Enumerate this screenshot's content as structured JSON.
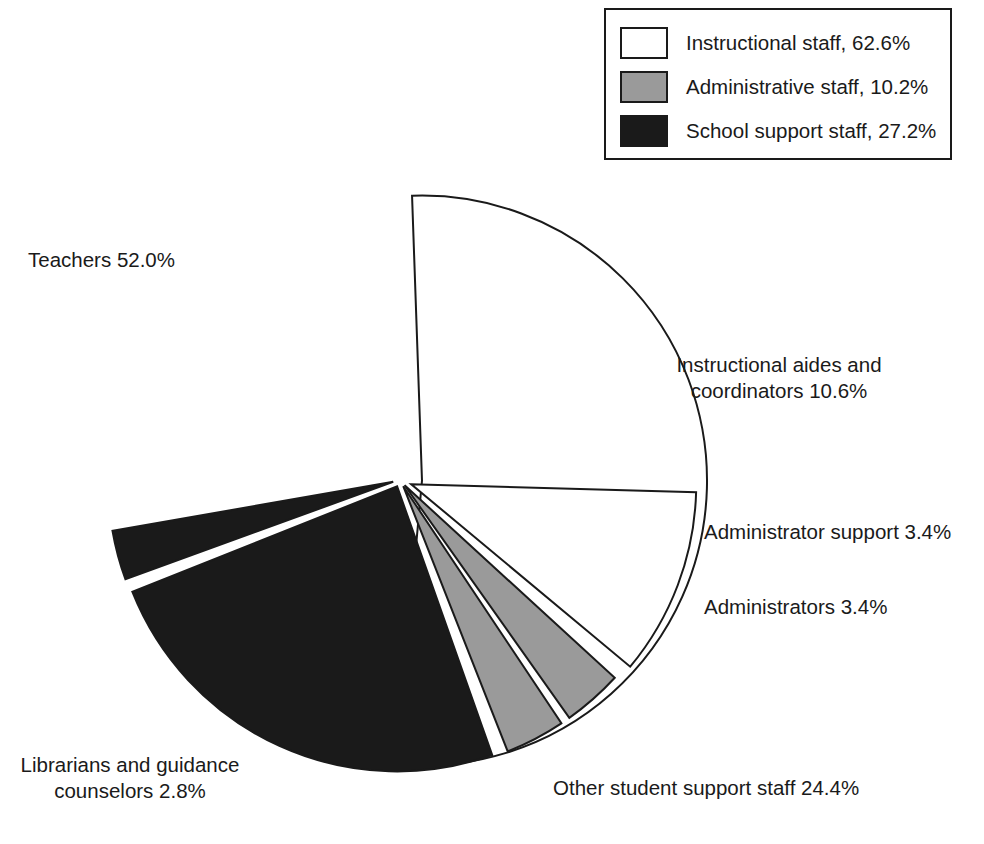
{
  "chart_data": {
    "type": "pie",
    "title": "",
    "total_percent": 100.0,
    "units": "percent",
    "legend": {
      "position": "top-right",
      "entries": [
        {
          "label": "Instructional staff, 62.6%",
          "name": "Instructional staff",
          "value": 62.6,
          "color": "#ffffff",
          "swatch": "white"
        },
        {
          "label": "Administrative staff, 10.2%",
          "name": "Administrative staff",
          "value": 10.2,
          "color": "#9a9a9a",
          "swatch": "gray"
        },
        {
          "label": "School support staff, 27.2%",
          "name": "School support staff",
          "value": 27.2,
          "color": "#1a1a1a",
          "swatch": "black"
        }
      ]
    },
    "categories": [
      "Teachers",
      "Instructional aides and coordinators",
      "Administrator support",
      "Administrators",
      "Other student support staff",
      "Librarians and guidance counselors"
    ],
    "values": [
      52.0,
      10.6,
      3.4,
      3.4,
      24.4,
      2.8
    ],
    "slices": [
      {
        "name": "teachers",
        "label": "Teachers 52.0%",
        "value": 52.0,
        "group": "Instructional staff",
        "color": "#ffffff",
        "start_deg": 268,
        "end_deg": 455.2,
        "explode": 22,
        "label_align": "left"
      },
      {
        "name": "instructional-aides",
        "label": "Instructional aides and\ncoordinators 10.6%",
        "value": 10.6,
        "group": "Instructional staff",
        "color": "#ffffff",
        "start_deg": 1.6,
        "end_deg": 39.8,
        "explode": 12,
        "label_align": "center"
      },
      {
        "name": "administrator-support",
        "label": "Administrator support 3.4%",
        "value": 3.4,
        "group": "Administrative staff",
        "color": "#9a9a9a",
        "start_deg": 42.5,
        "end_deg": 54.7,
        "explode": 7,
        "label_align": "left"
      },
      {
        "name": "administrators",
        "label": "Administrators 3.4%",
        "value": 3.4,
        "group": "Administrative staff",
        "color": "#9a9a9a",
        "start_deg": 56.3,
        "end_deg": 68.5,
        "explode": 7,
        "label_align": "left"
      },
      {
        "name": "other-student-support",
        "label": "Other student support staff 24.4%",
        "value": 24.4,
        "group": "School support staff",
        "color": "#1a1a1a",
        "start_deg": 70.5,
        "end_deg": 158.3,
        "explode": 7,
        "label_align": "left"
      },
      {
        "name": "librarians-guidance-counselors",
        "label": "Librarians and guidance\ncounselors 2.8%",
        "value": 2.8,
        "group": "School support staff",
        "color": "#1a1a1a",
        "start_deg": 160.0,
        "end_deg": 170.1,
        "explode": 7,
        "label_align": "center"
      }
    ],
    "geometry": {
      "center_x": 400,
      "center_y": 480,
      "radius": 285
    },
    "colors": {
      "outline": "#1a1a1a",
      "white": "#ffffff",
      "gray": "#9a9a9a",
      "black": "#1a1a1a",
      "background": "#ffffff"
    }
  },
  "labels": {
    "teachers": "Teachers 52.0%",
    "instructional_aides": "Instructional aides and\ncoordinators 10.6%",
    "administrator_support": "Administrator support 3.4%",
    "administrators": "Administrators 3.4%",
    "librarians": "Librarians and guidance\ncounselors 2.8%",
    "other_support": "Other student support staff 24.4%"
  }
}
